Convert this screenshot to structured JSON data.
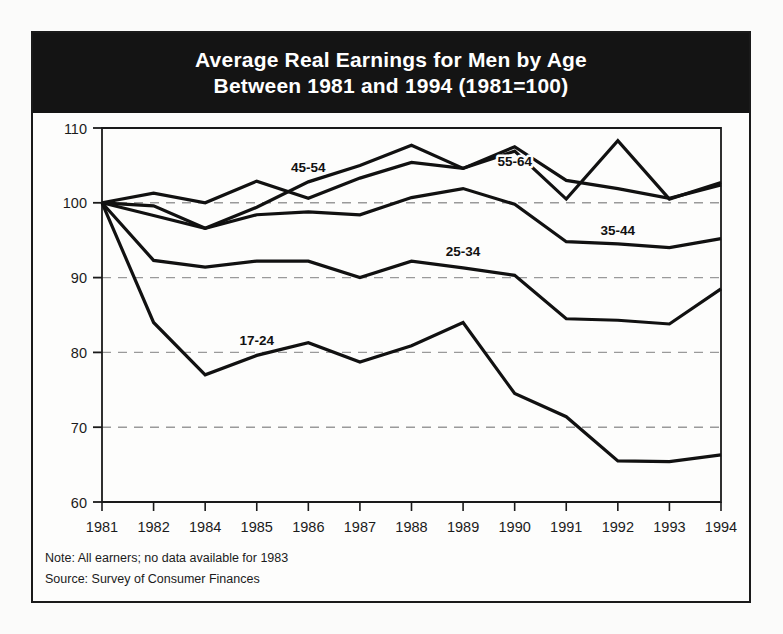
{
  "title": {
    "line1": "Average Real Earnings for Men by Age",
    "line2": "Between 1981 and 1994 (1981=100)"
  },
  "footnotes": {
    "note": "Note: All earners; no data available for 1983",
    "source": "Source: Survey of Consumer Finances"
  },
  "colors": {
    "banner_bg": "#141414",
    "banner_text": "#ffffff",
    "line": "#111111",
    "grid": "#9a9a9a",
    "axis": "#1a1a1a",
    "page_bg": "#fbfbfa"
  },
  "chart_data": {
    "type": "line",
    "title": "Average Real Earnings for Men by Age Between 1981 and 1994 (1981=100)",
    "xlabel": "",
    "ylabel": "",
    "grid": true,
    "legend_position": "inline-labels",
    "xlim": [
      1981,
      1994
    ],
    "ylim": [
      60,
      110
    ],
    "yticks": [
      60,
      70,
      80,
      90,
      100,
      110
    ],
    "categories": [
      "1981",
      "1982",
      "1984",
      "1985",
      "1986",
      "1987",
      "1988",
      "1989",
      "1990",
      "1991",
      "1992",
      "1993",
      "1994"
    ],
    "series": [
      {
        "name": "17-24",
        "label": "17-24",
        "label_x": "1985",
        "label_y": 81.6,
        "values": [
          100.0,
          84.0,
          77.0,
          79.6,
          81.3,
          78.7,
          80.9,
          84.0,
          74.5,
          71.4,
          65.5,
          65.4,
          66.3
        ]
      },
      {
        "name": "25-34",
        "label": "25-34",
        "label_x": "1989",
        "label_y": 93.6,
        "values": [
          100.0,
          92.3,
          91.4,
          92.2,
          92.2,
          90.0,
          92.2,
          91.3,
          90.3,
          84.5,
          84.3,
          83.8,
          88.5
        ]
      },
      {
        "name": "35-44",
        "label": "35-44",
        "label_x": "1992",
        "label_y": 96.3,
        "values": [
          100.0,
          98.3,
          96.6,
          98.4,
          98.8,
          98.4,
          100.7,
          101.9,
          99.8,
          94.8,
          94.5,
          94.0,
          95.2
        ]
      },
      {
        "name": "45-54",
        "label": "45-54",
        "label_x": "1986",
        "label_y": 104.8,
        "values": [
          100.0,
          101.3,
          100.0,
          102.9,
          100.6,
          103.3,
          105.4,
          104.6,
          107.5,
          103.0,
          101.9,
          100.6,
          102.4
        ]
      },
      {
        "name": "55-64",
        "label": "55-64",
        "label_x": "1990",
        "label_y": 105.6,
        "values": [
          100.0,
          99.6,
          96.6,
          99.4,
          102.8,
          105.0,
          107.7,
          104.6,
          106.9,
          100.5,
          108.3,
          100.5,
          102.7
        ]
      }
    ],
    "annotations": [
      "Note: All earners; no data available for 1983",
      "Source: Survey of Consumer Finances"
    ]
  }
}
